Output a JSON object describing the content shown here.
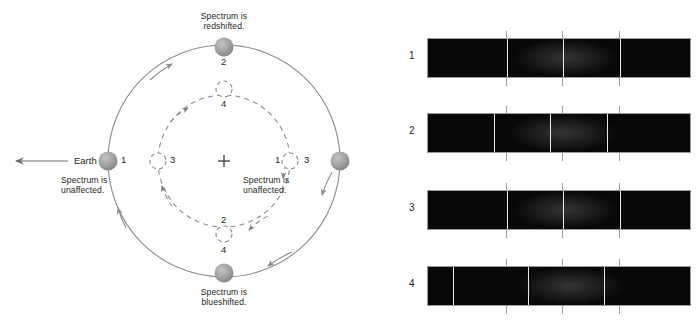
{
  "diagram": {
    "center_marker": "+",
    "earth": {
      "label": "Earth",
      "arrow": "left-arrow-icon"
    },
    "captions": {
      "top": "Spectrum is\nredshifted.",
      "bottom": "Spectrum is\nblueshifted.",
      "left": "Spectrum is\nunaffected.",
      "right": "Spectrum is\nunaffected."
    },
    "outer_orbit": {
      "style": "solid",
      "color": "#8c8c8c",
      "body_color": "#9e9e9e",
      "positions": [
        {
          "label": "1",
          "at": "left"
        },
        {
          "label": "2",
          "at": "top"
        },
        {
          "label": "3",
          "at": "right"
        },
        {
          "label": "4",
          "at": "bottom"
        }
      ]
    },
    "inner_orbit": {
      "style": "dashed",
      "color": "#8c8c8c",
      "body_color": "#ffffff",
      "positions": [
        {
          "label": "3",
          "at": "left"
        },
        {
          "label": "4",
          "at": "top"
        },
        {
          "label": "1",
          "at": "right"
        },
        {
          "label": "2",
          "at": "bottom"
        }
      ]
    }
  },
  "spectra": {
    "rows": [
      {
        "label": "1",
        "shift": "none",
        "lines": [
          28.5,
          57.0,
          85.5
        ],
        "ticks": [
          28.5,
          57.0,
          85.5
        ]
      },
      {
        "label": "2",
        "shift": "blueshift",
        "lines": [
          23.8,
          52.3,
          80.8
        ],
        "ticks": [
          28.5,
          57.0,
          85.5
        ]
      },
      {
        "label": "3",
        "shift": "none",
        "lines": [
          28.5,
          57.0,
          85.5
        ],
        "ticks": [
          28.5,
          57.0,
          85.5
        ]
      },
      {
        "label": "4",
        "shift": "redshift",
        "lines": [
          9.5,
          38.0,
          66.5
        ],
        "ticks": [
          28.5,
          57.0,
          85.5
        ]
      }
    ]
  },
  "colors": {
    "body": "#9e9e9e",
    "orbit": "#8c8c8c",
    "spectrum_background": "#080808",
    "spectrum_line": "#e9e9e9",
    "tick": "#9e9e9e",
    "text": "#231f20"
  }
}
